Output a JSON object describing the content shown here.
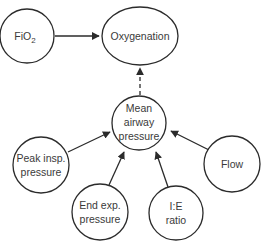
{
  "diagram": {
    "nodes": {
      "fio2": {
        "label": "FiO",
        "sub": "2"
      },
      "oxygenation": {
        "label": "Oxygenation"
      },
      "mean": {
        "line1": "Mean",
        "line2": "airway",
        "line3": "pressure"
      },
      "peak": {
        "line1": "Peak insp.",
        "line2": "pressure"
      },
      "endexp": {
        "line1": "End exp.",
        "line2": "pressure"
      },
      "ie": {
        "line1": "I:E",
        "line2": "ratio"
      },
      "flow": {
        "label": "Flow"
      }
    },
    "edges": [
      {
        "from": "FiO2",
        "to": "Oxygenation",
        "style": "solid"
      },
      {
        "from": "Mean airway pressure",
        "to": "Oxygenation",
        "style": "dashed"
      },
      {
        "from": "Peak insp. pressure",
        "to": "Mean airway pressure",
        "style": "solid"
      },
      {
        "from": "End exp. pressure",
        "to": "Mean airway pressure",
        "style": "solid"
      },
      {
        "from": "I:E ratio",
        "to": "Mean airway pressure",
        "style": "solid"
      },
      {
        "from": "Flow",
        "to": "Mean airway pressure",
        "style": "solid"
      }
    ]
  }
}
